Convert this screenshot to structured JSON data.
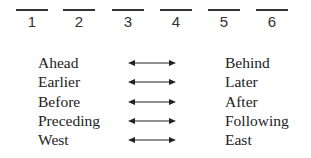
{
  "slots": [
    {
      "label": "1"
    },
    {
      "label": "2"
    },
    {
      "label": "3"
    },
    {
      "label": "4"
    },
    {
      "label": "5"
    },
    {
      "label": "6"
    }
  ],
  "pairs": [
    {
      "left": "Ahead",
      "right": "Behind"
    },
    {
      "left": "Earlier",
      "right": "Later"
    },
    {
      "left": "Before",
      "right": "After"
    },
    {
      "left": "Preceding",
      "right": "Following"
    },
    {
      "left": "West",
      "right": "East"
    }
  ],
  "icons": {
    "connector": "double-headed-arrow-icon"
  }
}
